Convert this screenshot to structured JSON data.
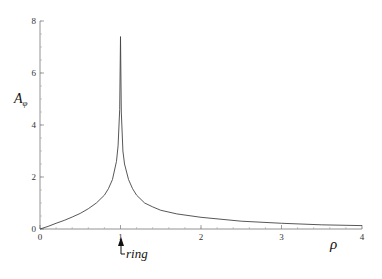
{
  "chart_data": {
    "type": "line",
    "title": "",
    "xlabel": "ρ",
    "ylabel": "A_φ",
    "ylabel_main": "A",
    "ylabel_sub": "φ",
    "xlim": [
      0,
      4
    ],
    "ylim": [
      0,
      8
    ],
    "grid": false,
    "legend": null,
    "x_ticks": [
      "0",
      "1",
      "2",
      "3",
      "4"
    ],
    "y_ticks": [
      "0",
      "2",
      "4",
      "6",
      "8"
    ],
    "annotation": {
      "text": "ring",
      "at_x": 1,
      "arrow": "up"
    },
    "series": [
      {
        "name": "A_phi",
        "x": [
          0,
          0.1,
          0.2,
          0.3,
          0.4,
          0.5,
          0.6,
          0.7,
          0.8,
          0.85,
          0.9,
          0.95,
          0.97,
          0.99,
          1.0,
          1.01,
          1.03,
          1.05,
          1.1,
          1.15,
          1.2,
          1.3,
          1.4,
          1.5,
          1.7,
          2.0,
          2.5,
          3.0,
          3.5,
          4.0
        ],
        "values": [
          0,
          0.1,
          0.22,
          0.33,
          0.46,
          0.6,
          0.78,
          1.0,
          1.3,
          1.55,
          1.9,
          2.6,
          3.2,
          4.6,
          7.4,
          4.5,
          3.0,
          2.5,
          1.9,
          1.55,
          1.3,
          1.0,
          0.85,
          0.72,
          0.58,
          0.45,
          0.3,
          0.22,
          0.16,
          0.13
        ]
      }
    ]
  }
}
